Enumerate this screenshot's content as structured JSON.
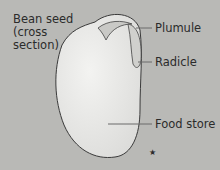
{
  "diagram": {
    "title_lines": [
      "Bean seed",
      "(cross",
      "section)"
    ],
    "labels": {
      "plumule": "Plumule",
      "radicle": "Radicle",
      "food_store": "Food store"
    },
    "marker": "★",
    "colors": {
      "background": "#b9b9b6",
      "seed_fill": "#ececea",
      "outline": "#3a3a3a",
      "leader_line": "#6a6a6a"
    }
  }
}
